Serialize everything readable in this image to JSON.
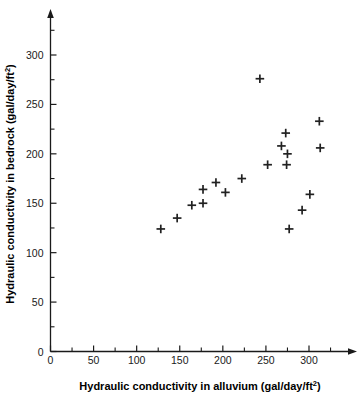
{
  "chart_data": {
    "type": "scatter",
    "title": "",
    "xlabel": "Hydraulic conductivity in alluvium (gal/day/ft2)",
    "ylabel": "Hydraulic conductivity in bedrock (gal/day/ft2)",
    "xlabel_main": "Hydraulic conductivity in alluvium (gal/day/ft",
    "xlabel_sup": "2",
    "xlabel_tail": ")",
    "ylabel_main": "Hydraulic conductivity in bedrock (gal/day/ft",
    "ylabel_sup": "2",
    "ylabel_tail": ")",
    "xlim": [
      0,
      340
    ],
    "ylim": [
      0,
      330
    ],
    "xticks": [
      0,
      50,
      100,
      150,
      200,
      250,
      300
    ],
    "yticks": [
      0,
      50,
      100,
      150,
      200,
      250,
      300
    ],
    "xtick_labels": [
      "0",
      "50",
      "100",
      "150",
      "200",
      "250",
      "300"
    ],
    "ytick_labels": [
      "0",
      "50",
      "100",
      "150",
      "200",
      "250",
      "300"
    ],
    "x_minor_ticks": [
      25,
      75,
      125,
      175,
      225,
      275,
      325
    ],
    "y_minor_ticks": [
      25,
      75,
      125,
      175,
      225,
      275,
      325
    ],
    "grid": false,
    "legend": null,
    "marker": "plus",
    "marker_color": "#212121",
    "points": [
      {
        "x": 128,
        "y": 124
      },
      {
        "x": 147,
        "y": 135
      },
      {
        "x": 164,
        "y": 148
      },
      {
        "x": 177,
        "y": 150
      },
      {
        "x": 177,
        "y": 164
      },
      {
        "x": 192,
        "y": 171
      },
      {
        "x": 203,
        "y": 161
      },
      {
        "x": 222,
        "y": 175
      },
      {
        "x": 243,
        "y": 276
      },
      {
        "x": 252,
        "y": 189
      },
      {
        "x": 268,
        "y": 208
      },
      {
        "x": 273,
        "y": 221
      },
      {
        "x": 275,
        "y": 200
      },
      {
        "x": 274,
        "y": 189
      },
      {
        "x": 277,
        "y": 124
      },
      {
        "x": 292,
        "y": 143
      },
      {
        "x": 301,
        "y": 159
      },
      {
        "x": 312,
        "y": 233
      },
      {
        "x": 313,
        "y": 206
      }
    ]
  },
  "axis_titles": {
    "x_prefix": "Hydraulic conductivity in alluvium (gal/day/ft",
    "x_sup": "2",
    "x_suffix": ")",
    "y_prefix": "Hydraulic conductivity in bedrock (gal/day/ft",
    "y_sup": "2",
    "y_suffix": ")"
  }
}
